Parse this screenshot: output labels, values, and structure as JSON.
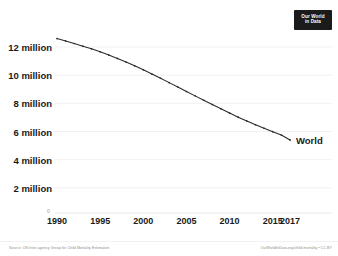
{
  "logo": {
    "line1": "Our World",
    "line2": "in Data"
  },
  "axes": {
    "y_ticks": [
      {
        "label": "2 million",
        "value": 2000000
      },
      {
        "label": "4 million",
        "value": 4000000
      },
      {
        "label": "6 million",
        "value": 6000000
      },
      {
        "label": "8 million",
        "value": 8000000
      },
      {
        "label": "10 million",
        "value": 10000000
      },
      {
        "label": "12 million",
        "value": 12000000
      }
    ],
    "zero_label": "0",
    "x_ticks": [
      {
        "label": "1990",
        "value": 1990
      },
      {
        "label": "1995",
        "value": 1995
      },
      {
        "label": "2000",
        "value": 2000
      },
      {
        "label": "2005",
        "value": 2005
      },
      {
        "label": "2010",
        "value": 2010
      },
      {
        "label": "2015",
        "value": 2015
      },
      {
        "label": "2017",
        "value": 2017
      }
    ]
  },
  "series_label": "World",
  "footer": {
    "source": "Source: UN Inter-agency Group for Child Mortality Estimation",
    "license": "OurWorldInData.org/child-mortality • CC BY"
  },
  "colors": {
    "line": "#2b2b2b",
    "gridline": "#ededed",
    "text": "#1a1a1a",
    "muted": "#8d8d8d",
    "logo_bg": "#1b1b1b"
  },
  "chart_data": {
    "type": "line",
    "title": "",
    "xlabel": "",
    "ylabel": "",
    "xlim": [
      1990,
      2017
    ],
    "ylim": [
      0,
      13000000
    ],
    "grid": true,
    "legend": "inline-right",
    "series": [
      {
        "name": "World",
        "x": [
          1990,
          1991,
          1992,
          1993,
          1994,
          1995,
          1996,
          1997,
          1998,
          1999,
          2000,
          2001,
          2002,
          2003,
          2004,
          2005,
          2006,
          2007,
          2008,
          2009,
          2010,
          2011,
          2012,
          2013,
          2014,
          2015,
          2016,
          2017
        ],
        "values": [
          12600000,
          12430000,
          12250000,
          12060000,
          11870000,
          11660000,
          11430000,
          11190000,
          10930000,
          10660000,
          10380000,
          10080000,
          9780000,
          9470000,
          9160000,
          8840000,
          8530000,
          8220000,
          7910000,
          7610000,
          7310000,
          7020000,
          6740000,
          6480000,
          6230000,
          5990000,
          5750000,
          5400000
        ]
      }
    ]
  }
}
